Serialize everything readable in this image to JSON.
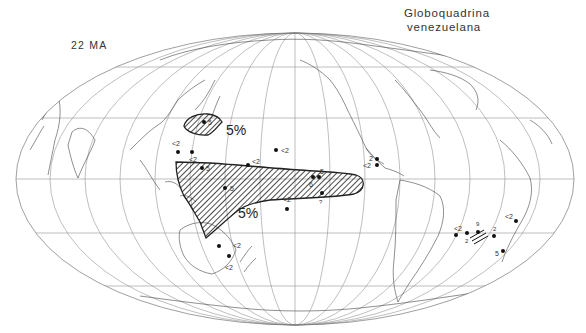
{
  "figure": {
    "species": [
      "Globoquadrina",
      "venezuelana"
    ],
    "age": "22 MA",
    "projection": "mollweide-like ellipse, Pacific-centered",
    "colors": {
      "ink": "#222222",
      "grid": "#8a8a8a",
      "background": "#ffffff"
    }
  },
  "contours": [
    {
      "id": "north-pacific-patch",
      "label": "5%",
      "label_x": 298,
      "label_y": 130
    },
    {
      "id": "equatorial-pacific-belt",
      "label": "5%",
      "label_x": 215,
      "label_y": 217
    }
  ],
  "sites": [
    {
      "x": 204,
      "y": 122,
      "label": "5",
      "lx": 208,
      "ly": 125
    },
    {
      "x": 178,
      "y": 152,
      "label": "<2",
      "lx": 170,
      "ly": 143
    },
    {
      "x": 192,
      "y": 152,
      "label": "<2",
      "lx": 190,
      "ly": 161
    },
    {
      "x": 202,
      "y": 168,
      "label": "5",
      "lx": 207,
      "ly": 171
    },
    {
      "x": 248,
      "y": 165,
      "label": "<2",
      "lx": 252,
      "ly": 163
    },
    {
      "x": 276,
      "y": 150,
      "label": "<2",
      "lx": 281,
      "ly": 153
    },
    {
      "x": 225,
      "y": 188,
      "label": "5",
      "lx": 230,
      "ly": 190
    },
    {
      "x": 313,
      "y": 177,
      "label": "5",
      "lx": 321,
      "ly": 173
    },
    {
      "x": 319,
      "y": 177,
      "label": "6",
      "lx": 310,
      "ly": 186
    },
    {
      "x": 322,
      "y": 193,
      "label": "?",
      "lx": 318,
      "ly": 204
    },
    {
      "x": 287,
      "y": 209,
      "label": "<2",
      "lx": 283,
      "ly": 201
    },
    {
      "x": 377,
      "y": 159,
      "label": "2",
      "lx": 369,
      "ly": 160
    },
    {
      "x": 377,
      "y": 165,
      "label": "<2",
      "lx": 364,
      "ly": 169
    },
    {
      "x": 219,
      "y": 246,
      "label": "<2",
      "lx": 233,
      "ly": 249
    },
    {
      "x": 229,
      "y": 256,
      "label": "<2",
      "lx": 226,
      "ly": 270
    },
    {
      "x": 456,
      "y": 235,
      "label": "<2",
      "lx": 452,
      "ly": 231
    },
    {
      "x": 467,
      "y": 233,
      "label": "2",
      "lx": 465,
      "ly": 243
    },
    {
      "x": 478,
      "y": 232,
      "label": "9",
      "lx": 476,
      "ly": 226
    },
    {
      "x": 494,
      "y": 236,
      "label": "2",
      "lx": 494,
      "ly": 232
    },
    {
      "x": 516,
      "y": 221,
      "label": "<2",
      "lx": 504,
      "ly": 219
    },
    {
      "x": 503,
      "y": 251,
      "label": "5",
      "lx": 495,
      "ly": 256
    }
  ]
}
